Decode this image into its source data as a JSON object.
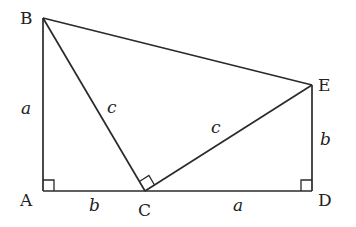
{
  "diagram": {
    "type": "geometry-trapezoid",
    "points": {
      "A": {
        "label": "A",
        "x": 43,
        "y": 191
      },
      "B": {
        "label": "B",
        "x": 43,
        "y": 18
      },
      "C": {
        "label": "C",
        "x": 145,
        "y": 191
      },
      "D": {
        "label": "D",
        "x": 312,
        "y": 191
      },
      "E": {
        "label": "E",
        "x": 312,
        "y": 85
      }
    },
    "segments": [
      {
        "from": "A",
        "to": "B",
        "label": "a"
      },
      {
        "from": "B",
        "to": "C",
        "label": "c"
      },
      {
        "from": "C",
        "to": "E",
        "label": "c"
      },
      {
        "from": "E",
        "to": "D",
        "label": "b"
      },
      {
        "from": "A",
        "to": "C",
        "label": "b"
      },
      {
        "from": "C",
        "to": "D",
        "label": "a"
      },
      {
        "from": "B",
        "to": "E",
        "label": ""
      }
    ],
    "right_angles": [
      "A",
      "C",
      "D"
    ],
    "labels": {
      "A": "A",
      "B": "B",
      "C": "C",
      "D": "D",
      "E": "E",
      "AB": "a",
      "BC": "c",
      "CE": "c",
      "ED": "b",
      "AC": "b",
      "CD": "a"
    }
  }
}
